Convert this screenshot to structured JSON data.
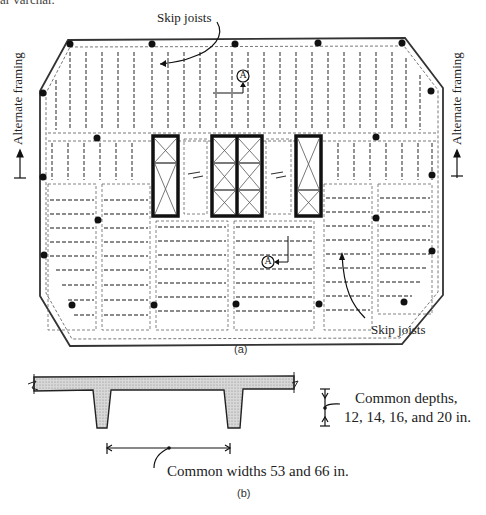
{
  "figure": {
    "top_fragment": "ar varchar.",
    "part_a": {
      "caption": "(a)",
      "labels": {
        "skip_joists_top": "Skip joists",
        "skip_joists_bottom": "Skip joists",
        "alternate_framing_left": "Alternate framing",
        "alternate_framing_right": "Alternate framing",
        "section_marker_top": "A",
        "section_marker_bottom": "A"
      }
    },
    "part_b": {
      "caption": "(b)",
      "labels": {
        "depth_note_line1": "Common depths,",
        "depth_note_line2": "12, 14, 16, and 20 in.",
        "width_note": "Common widths 53 and 66 in."
      }
    },
    "bottom_fragment": "Figure 1.3  Floor system with skip joists..."
  }
}
